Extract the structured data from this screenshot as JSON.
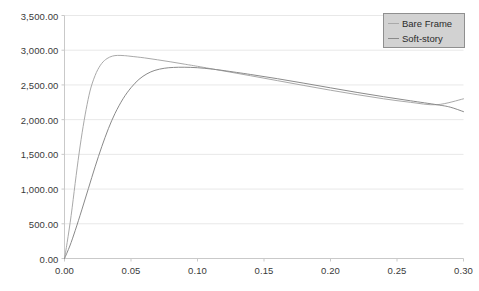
{
  "chart_data": {
    "type": "line",
    "title": "",
    "xlabel": "",
    "ylabel": "",
    "xlim": [
      0.0,
      0.3
    ],
    "ylim": [
      0.0,
      3500.0
    ],
    "grid": true,
    "legend_position": "top-right",
    "x_ticks": [
      "0.00",
      "0.05",
      "0.10",
      "0.15",
      "0.20",
      "0.25",
      "0.30"
    ],
    "x_tick_values": [
      0.0,
      0.05,
      0.1,
      0.15,
      0.2,
      0.25,
      0.3
    ],
    "y_ticks": [
      "0.00",
      "500.00",
      "1,000.00",
      "1,500.00",
      "2,000.00",
      "2,500.00",
      "3,000.00",
      "3,500.00"
    ],
    "y_tick_values": [
      0,
      500,
      1000,
      1500,
      2000,
      2500,
      3000,
      3500
    ],
    "series": [
      {
        "name": "Bare Frame",
        "color": "#a9a9a9",
        "x": [
          0.0,
          0.002,
          0.005,
          0.008,
          0.011,
          0.014,
          0.017,
          0.02,
          0.024,
          0.028,
          0.032,
          0.036,
          0.04,
          0.045,
          0.05,
          0.06,
          0.07,
          0.08,
          0.09,
          0.1,
          0.12,
          0.14,
          0.16,
          0.18,
          0.2,
          0.22,
          0.24,
          0.26,
          0.28,
          0.3
        ],
        "values": [
          0,
          230,
          620,
          1080,
          1520,
          1900,
          2220,
          2470,
          2680,
          2810,
          2880,
          2915,
          2925,
          2922,
          2912,
          2890,
          2862,
          2832,
          2800,
          2768,
          2700,
          2632,
          2562,
          2492,
          2424,
          2360,
          2300,
          2250,
          2215,
          2300
        ]
      },
      {
        "name": "Soft-story",
        "color": "#8a8a8a",
        "x": [
          0.0,
          0.004,
          0.008,
          0.013,
          0.018,
          0.023,
          0.028,
          0.033,
          0.038,
          0.044,
          0.05,
          0.056,
          0.062,
          0.068,
          0.075,
          0.082,
          0.09,
          0.1,
          0.11,
          0.12,
          0.14,
          0.16,
          0.18,
          0.2,
          0.22,
          0.24,
          0.26,
          0.28,
          0.29,
          0.3
        ],
        "values": [
          0,
          180,
          400,
          700,
          1010,
          1320,
          1610,
          1870,
          2090,
          2300,
          2460,
          2580,
          2660,
          2710,
          2740,
          2752,
          2755,
          2748,
          2730,
          2706,
          2650,
          2590,
          2525,
          2458,
          2392,
          2330,
          2272,
          2215,
          2180,
          2115
        ]
      }
    ]
  },
  "legend": {
    "items": [
      {
        "label": "Bare Frame",
        "color": "#a9a9a9"
      },
      {
        "label": "Soft-story",
        "color": "#8a8a8a"
      }
    ]
  },
  "axes": {
    "grid_color": "#e8e8e8",
    "axis_color": "#c9c9c9",
    "tick_text_color": "#3a3a3a"
  }
}
